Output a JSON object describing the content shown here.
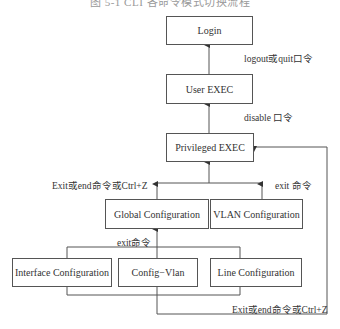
{
  "caption": "图 5-1  CLI 各命令模式切换流程",
  "nodes": {
    "login": "Login",
    "user_exec": "User EXEC",
    "privileged_exec": "Privileged EXEC",
    "global_config": "Global Configuration",
    "vlan_config": "VLAN Configuration",
    "interface_config": "Interface Configuration",
    "config_vlan": "Config−Vlan",
    "line_config": "Line Configuration"
  },
  "edge_labels": {
    "user_to_login": "logout或quit口令",
    "priv_to_user": "disable 口令",
    "global_to_priv": "Exit或end命令或Ctrl+Z",
    "vlan_to_priv": "exit 命令",
    "sub_to_global": "exit命令",
    "sub_to_priv": "Exit或end命令或Ctrl+Z"
  },
  "colors": {
    "line": "#555555",
    "text": "#333333",
    "background": "#ffffff"
  }
}
